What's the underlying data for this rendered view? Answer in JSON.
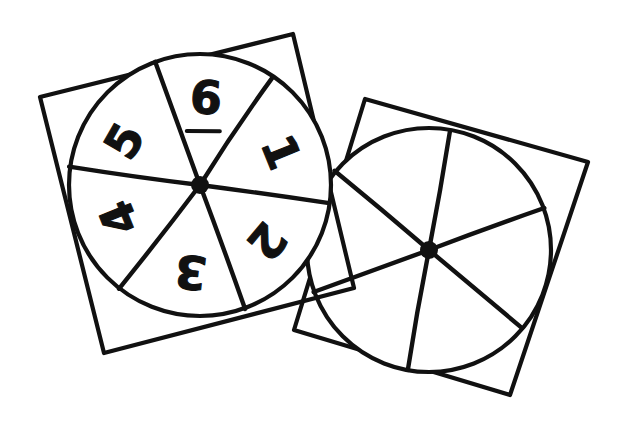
{
  "figure": {
    "canvas": {
      "width": 635,
      "height": 425,
      "background": "#ffffff"
    },
    "ink_color": "#111111",
    "stroke_width": 4.2
  },
  "spinners": [
    {
      "id": "left-spinner",
      "label": "numbered-spinner",
      "numbered": true,
      "sector_count": 6,
      "card": {
        "rotation_deg": -14,
        "corners": [
          [
            40,
            97
          ],
          [
            293,
            34
          ],
          [
            354,
            288
          ],
          [
            104,
            353
          ]
        ]
      },
      "circle": {
        "cx": 200,
        "cy": 185,
        "r": 131
      },
      "pivot": {
        "cx": 200,
        "cy": 185,
        "r": 9
      },
      "sectors": [
        {
          "value": "1",
          "label_angle_deg": -22,
          "label_radius": 84,
          "text_rotation_deg": 68,
          "underlined": false
        },
        {
          "value": "2",
          "label_angle_deg": 40,
          "label_radius": 84,
          "text_rotation_deg": 130,
          "underlined": false
        },
        {
          "value": "3",
          "label_angle_deg": 96,
          "label_radius": 84,
          "text_rotation_deg": 186,
          "underlined": false
        },
        {
          "value": "4",
          "label_angle_deg": 158,
          "label_radius": 84,
          "text_rotation_deg": 248,
          "underlined": false
        },
        {
          "value": "5",
          "label_angle_deg": -150,
          "label_radius": 84,
          "text_rotation_deg": 300,
          "underlined": false
        },
        {
          "value": "6",
          "label_angle_deg": -86,
          "label_radius": 84,
          "text_rotation_deg": 4,
          "underlined": true
        }
      ],
      "divider_angles_deg": [
        -56,
        8,
        70,
        128,
        188,
        250
      ]
    },
    {
      "id": "right-spinner",
      "label": "blank-spinner",
      "numbered": false,
      "sector_count": 6,
      "card": {
        "rotation_deg": 16,
        "corners": [
          [
            365,
            99
          ],
          [
            588,
            162
          ],
          [
            510,
            395
          ],
          [
            294,
            330
          ]
        ]
      },
      "circle": {
        "cx": 429,
        "cy": 250,
        "r": 122
      },
      "pivot": {
        "cx": 429,
        "cy": 250,
        "r": 9
      },
      "sectors": [
        {
          "value": "",
          "label_angle_deg": -50,
          "label_radius": 78,
          "text_rotation_deg": 0,
          "underlined": false
        },
        {
          "value": "",
          "label_angle_deg": 10,
          "label_radius": 78,
          "text_rotation_deg": 0,
          "underlined": false
        },
        {
          "value": "",
          "label_angle_deg": 70,
          "label_radius": 78,
          "text_rotation_deg": 0,
          "underlined": false
        },
        {
          "value": "",
          "label_angle_deg": 130,
          "label_radius": 78,
          "text_rotation_deg": 0,
          "underlined": false
        },
        {
          "value": "",
          "label_angle_deg": -170,
          "label_radius": 78,
          "text_rotation_deg": 0,
          "underlined": false
        },
        {
          "value": "",
          "label_angle_deg": -110,
          "label_radius": 78,
          "text_rotation_deg": 0,
          "underlined": false
        }
      ],
      "divider_angles_deg": [
        -80,
        -20,
        40,
        100,
        160,
        220
      ]
    }
  ]
}
